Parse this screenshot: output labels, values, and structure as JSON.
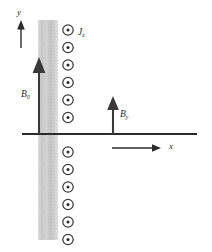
{
  "figure": {
    "width": 212,
    "height": 252,
    "background": "#ffffff",
    "stroke_color": "#2b2b2b",
    "band_color": "#cfcfcf"
  },
  "axes": {
    "y_label": "y",
    "x_label": "x",
    "y_axis": {
      "x": 21,
      "y_top": 22,
      "y_bottom": 134
    },
    "x_axis": {
      "y": 134,
      "x_left": 22,
      "x_right": 197
    },
    "x_arrow": {
      "y": 148,
      "x_start": 112,
      "x_end": 161
    }
  },
  "slab": {
    "name": "conducting-slab",
    "x": 38,
    "width": 20,
    "y_top": 20,
    "y_bottom": 240,
    "fill": "#cfcfcf"
  },
  "current": {
    "label": "J",
    "subscript": "z",
    "symbol_name": "circle-dot-out-of-page",
    "column_x": 68,
    "count": 12,
    "radius": 5.2,
    "spacing": 17.5,
    "y_positions": [
      30,
      47.5,
      65,
      82.5,
      100,
      117.5,
      152,
      169.5,
      187,
      204.5,
      222,
      239.5
    ]
  },
  "vectors": [
    {
      "name": "B0-arrow",
      "label": "B",
      "subscript": "0",
      "x": 39,
      "y_base": 134,
      "y_tip": 58,
      "label_x": 22,
      "label_y": 93
    },
    {
      "name": "By-arrow",
      "label": "B",
      "subscript": "y",
      "x": 113,
      "y_base": 134,
      "y_tip": 97,
      "label_x": 120,
      "label_y": 113
    }
  ],
  "labels": {
    "y_axis_label_pos": {
      "x": 17,
      "y": 10
    },
    "x_axis_label_pos": {
      "x": 169,
      "y": 143
    },
    "current_label_pos": {
      "x": 78,
      "y": 29
    }
  }
}
